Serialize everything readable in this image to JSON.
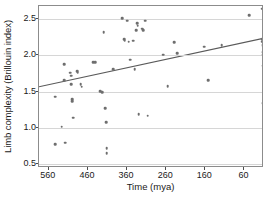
{
  "chart_data": {
    "type": "scatter",
    "title": "",
    "xlabel": "Time (mya)",
    "ylabel": "Limb complexity (Brillouin index)",
    "xlim": [
      585,
      10
    ],
    "ylim": [
      0.45,
      2.68
    ],
    "x_reversed": true,
    "grid": true,
    "legend": "none",
    "xticks": [
      560,
      460,
      360,
      260,
      160,
      60
    ],
    "xtick_labels": [
      "560",
      "460",
      "360",
      "260",
      "160",
      "60"
    ],
    "yticks": [
      0.5,
      1.0,
      1.5,
      2.0,
      2.5
    ],
    "ytick_labels": [
      "0.5",
      "1.0",
      "1.5",
      "2.0",
      "2.5"
    ],
    "marker_color": "#6e6e6e",
    "line_color": "#5a5a5a",
    "grid_color": "#d6d6d6",
    "axis_color": "#8c8c8c",
    "points": [
      [
        543,
        1.43
      ],
      [
        543,
        0.78
      ],
      [
        527,
        1.02
      ],
      [
        520,
        1.88
      ],
      [
        520,
        1.66
      ],
      [
        518,
        0.8
      ],
      [
        505,
        1.76
      ],
      [
        503,
        1.72
      ],
      [
        502,
        1.6
      ],
      [
        500,
        1.4
      ],
      [
        500,
        1.37
      ],
      [
        497,
        1.14
      ],
      [
        487,
        1.78
      ],
      [
        486,
        1.76
      ],
      [
        478,
        1.6
      ],
      [
        476,
        1.57
      ],
      [
        447,
        1.91
      ],
      [
        441,
        1.91
      ],
      [
        428,
        1.51
      ],
      [
        424,
        1.49
      ],
      [
        420,
        2.32
      ],
      [
        416,
        1.27
      ],
      [
        413,
        1.08
      ],
      [
        412,
        0.72
      ],
      [
        412,
        0.65
      ],
      [
        396,
        1.81
      ],
      [
        372,
        2.51
      ],
      [
        367,
        2.22
      ],
      [
        366,
        2.2
      ],
      [
        360,
        2.48
      ],
      [
        356,
        2.19
      ],
      [
        352,
        1.94
      ],
      [
        344,
        2.2
      ],
      [
        340,
        1.81
      ],
      [
        337,
        2.35
      ],
      [
        334,
        2.44
      ],
      [
        333,
        2.41
      ],
      [
        330,
        1.19
      ],
      [
        322,
        2.37
      ],
      [
        318,
        2.35
      ],
      [
        313,
        2.48
      ],
      [
        307,
        1.17
      ],
      [
        268,
        2.01
      ],
      [
        256,
        1.58
      ],
      [
        240,
        2.18
      ],
      [
        232,
        2.03
      ],
      [
        163,
        2.12
      ],
      [
        152,
        1.66
      ],
      [
        118,
        2.14
      ],
      [
        48,
        2.55
      ],
      [
        16,
        2.64
      ],
      [
        14,
        2.22
      ],
      [
        14,
        2.19
      ],
      [
        13,
        2.14
      ],
      [
        12,
        2.04
      ],
      [
        12,
        2.01
      ],
      [
        12,
        1.86
      ],
      [
        12,
        1.34
      ]
    ],
    "trendline": {
      "x_start": 585,
      "y_start": 1.555,
      "x_end": 10,
      "y_end": 2.225
    }
  }
}
